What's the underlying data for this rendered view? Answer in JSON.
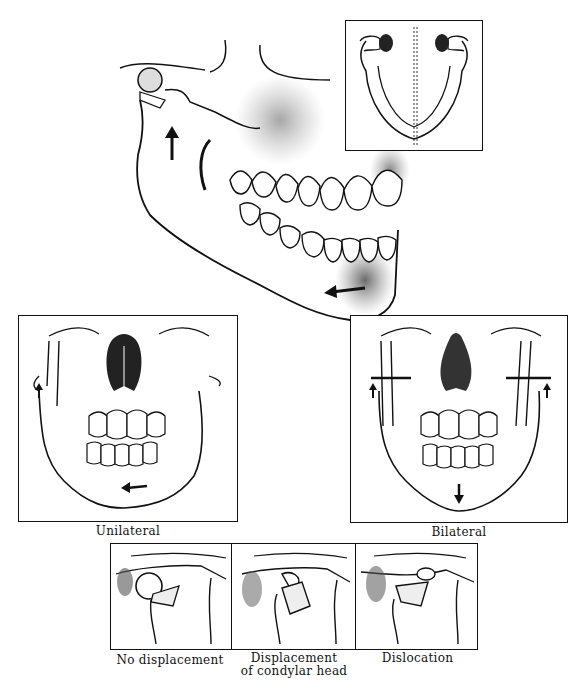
{
  "figure": {
    "main_view": {
      "label": "Lateral oblique view of skull and mandible",
      "arrows": [
        "upward arrow at ramus",
        "leftward arrow at chin"
      ]
    },
    "inset_top": {
      "label": "Superior view of mandible with midline",
      "colors": {
        "border": "#111111"
      }
    },
    "panels": [
      {
        "id": "unilateral",
        "caption": "Unilateral"
      },
      {
        "id": "bilateral",
        "caption": "Bilateral"
      }
    ],
    "condyle_panels": [
      {
        "id": "no-displacement",
        "caption": "No displacement"
      },
      {
        "id": "displacement",
        "caption_line1": "Displacement",
        "caption_line2": "of condylar head"
      },
      {
        "id": "dislocation",
        "caption": "Dislocation"
      }
    ],
    "colors": {
      "ink": "#111111",
      "shade": "#555555",
      "paper": "#ffffff"
    }
  }
}
